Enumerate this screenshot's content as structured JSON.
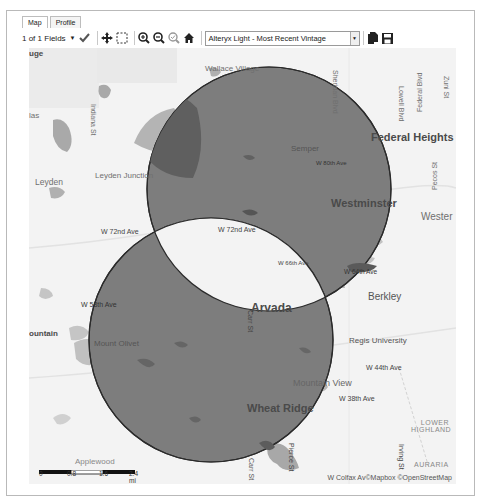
{
  "tabs": [
    {
      "label": "Map",
      "active": true
    },
    {
      "label": "Profile",
      "active": false
    }
  ],
  "toolbar": {
    "fields_label": "1 of 1 Fields",
    "icons": [
      "dropdown-icon",
      "checkmark-icon",
      "pan-icon",
      "select-rectangle-icon",
      "zoom-in-icon",
      "zoom-out-icon",
      "zoom-selection-icon",
      "home-icon"
    ],
    "basemap_value": "Alteryx Light - Most Recent Vintage",
    "export_icons": [
      "copy-icon",
      "save-icon"
    ]
  },
  "map": {
    "colors": {
      "background": "#f3f3f3",
      "polygon_fill": "#7d7d7d",
      "polygon_stroke": "#2b2b2b",
      "water": "#a9a9a9",
      "park": "#dcdcdc"
    },
    "circles": [
      {
        "name": "circle-north",
        "cx": 240,
        "cy": 141,
        "r": 122
      },
      {
        "name": "circle-south",
        "cx": 182,
        "cy": 292,
        "r": 122
      }
    ],
    "labels": {
      "uge": "uge",
      "las": "las",
      "indiana_st": "Indiana St",
      "wallace_village": "Wallace Village",
      "sheridan_blvd": "Sheridan Blvd",
      "lowell_blvd": "Lowell Blvd",
      "federal_blvd": "Federal Blvd",
      "zuni_st": "Zuni St",
      "federal_heights": "Federal Heights",
      "semper": "Semper",
      "w80th": "W 80th Ave",
      "leyden": "Leyden",
      "leyden_junction": "Leyden Junction",
      "pecos_st": "Pecos St",
      "westminster": "Westminster",
      "wester": "Wester",
      "w72nd_left": "W 72nd Ave",
      "w72nd_mid": "W 72nd Ave",
      "w66th": "W 66th Ave",
      "w64th": "W 64th Ave",
      "w58th": "W 58th Ave",
      "arvada": "Arvada",
      "berkley": "Berkley",
      "ountain": "ountain",
      "mount_olivet": "Mount Olivet",
      "carr_st": "Carr St",
      "regis_university": "Regis University",
      "w44th": "W 44th Ave",
      "mountain_view": "Mountain View",
      "w38th": "W 38th Ave",
      "wheat_ridge": "Wheat Ridge",
      "lower_highland": "LOWER HIGHLAND",
      "pierce_st": "Pierce St",
      "irving_st": "Irving St",
      "auraria": "AURARIA",
      "applewood": "Applewood",
      "carr_st_bottom": "Carr St",
      "w_colfax": "W Colfax Av"
    },
    "scale": {
      "ticks": [
        "0",
        "0.8",
        "1.6",
        "2.4 mi"
      ]
    },
    "attribution": "©Mapbox ©OpenStreetMap"
  }
}
